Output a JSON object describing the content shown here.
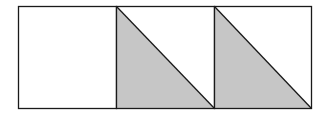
{
  "diagram": {
    "colors": {
      "background": "#ffffff",
      "stroke": "#1a1a1a",
      "shade": "#c6c6c6"
    },
    "outer": {
      "x": 18.5,
      "y": 6.5,
      "width": 293,
      "height": 102
    },
    "cells": [
      {
        "index": 1,
        "x": 18.5,
        "width": 98,
        "shaded_triangle": false
      },
      {
        "index": 2,
        "x": 116.5,
        "width": 98,
        "shaded_triangle": true
      },
      {
        "index": 3,
        "x": 214.5,
        "width": 97,
        "shaded_triangle": true
      }
    ]
  }
}
